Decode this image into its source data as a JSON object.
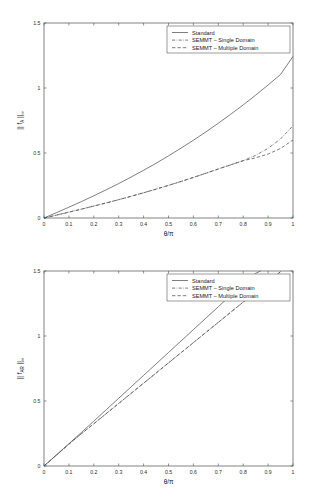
{
  "figure": {
    "background": "#ffffff",
    "line_color": "#545454",
    "axis_color": "#4d4d4d"
  },
  "legend": {
    "position": "top-right-inside",
    "entries": [
      {
        "label": "Standard",
        "style": "solid"
      },
      {
        "label": "SEMMT – Single Domain",
        "style": "dash-dot"
      },
      {
        "label": "SEMMT – Multiple Domain",
        "style": "dashed"
      }
    ]
  },
  "chart_data": [
    {
      "id": "top",
      "type": "line",
      "title": "",
      "xlabel": "θ/π",
      "ylabel": "|| f_A ||_∞",
      "ylabel_parts": {
        "prefix": "|| f",
        "sub": "A",
        "mid": " ||",
        "sup": "∞"
      },
      "xlim": [
        0,
        1
      ],
      "ylim": [
        0,
        1.5
      ],
      "grid": false,
      "xticks": [
        0,
        0.1,
        0.2,
        0.3,
        0.4,
        0.5,
        0.6,
        0.7,
        0.8,
        0.9,
        1
      ],
      "xticklabels": [
        "0",
        "0.1",
        "0.2",
        "0.3",
        "0.4",
        "0.5",
        "0.6",
        "0.7",
        "0.8",
        "0.9",
        "1"
      ],
      "yticks": [
        0,
        0.5,
        1,
        1.5
      ],
      "yticklabels": [
        "0",
        "0.5",
        "1",
        "1.5"
      ],
      "x": [
        0,
        0.05,
        0.1,
        0.15,
        0.2,
        0.25,
        0.3,
        0.35,
        0.4,
        0.45,
        0.5,
        0.55,
        0.6,
        0.65,
        0.7,
        0.75,
        0.8,
        0.85,
        0.9,
        0.95,
        1
      ],
      "series": [
        {
          "name": "Standard",
          "style": "solid",
          "values": [
            0,
            0.041,
            0.083,
            0.126,
            0.171,
            0.217,
            0.265,
            0.315,
            0.367,
            0.421,
            0.478,
            0.537,
            0.598,
            0.662,
            0.729,
            0.798,
            0.87,
            0.945,
            1.023,
            1.104,
            1.243
          ]
        },
        {
          "name": "SEMMT – Single Domain",
          "style": "dash-dot",
          "values": [
            0,
            0.022,
            0.045,
            0.068,
            0.092,
            0.116,
            0.141,
            0.167,
            0.194,
            0.222,
            0.251,
            0.281,
            0.312,
            0.344,
            0.377,
            0.409,
            0.441,
            0.482,
            0.536,
            0.608,
            0.71
          ]
        },
        {
          "name": "SEMMT – Multiple Domain",
          "style": "dashed",
          "values": [
            0,
            0.022,
            0.045,
            0.068,
            0.092,
            0.116,
            0.141,
            0.167,
            0.194,
            0.222,
            0.251,
            0.281,
            0.312,
            0.344,
            0.377,
            0.409,
            0.441,
            0.463,
            0.492,
            0.535,
            0.6
          ]
        }
      ]
    },
    {
      "id": "bottom",
      "type": "line",
      "title": "",
      "xlabel": "θ/π",
      "ylabel": "|| f_AR ||_∞",
      "ylabel_parts": {
        "prefix": "|| f",
        "sub": "AR",
        "mid": " ||",
        "sup": "∞"
      },
      "xlim": [
        0,
        1
      ],
      "ylim": [
        0,
        1.5
      ],
      "grid": false,
      "xticks": [
        0,
        0.1,
        0.2,
        0.3,
        0.4,
        0.5,
        0.6,
        0.7,
        0.8,
        0.9,
        1
      ],
      "xticklabels": [
        "0",
        "0.1",
        "0.2",
        "0.3",
        "0.4",
        "0.5",
        "0.6",
        "0.7",
        "0.8",
        "0.9",
        "1"
      ],
      "yticks": [
        0,
        0.5,
        1,
        1.5
      ],
      "yticklabels": [
        "0",
        "0.5",
        "1",
        "1.5"
      ],
      "x": [
        0,
        0.05,
        0.1,
        0.15,
        0.2,
        0.25,
        0.3,
        0.35,
        0.4,
        0.45,
        0.5,
        0.55,
        0.6,
        0.65,
        0.7,
        0.75,
        0.8,
        0.85,
        0.87
      ],
      "series": [
        {
          "name": "Standard",
          "style": "solid",
          "values": [
            0,
            0.085,
            0.171,
            0.258,
            0.345,
            0.433,
            0.521,
            0.609,
            0.697,
            0.785,
            0.873,
            0.961,
            1.049,
            1.137,
            1.225,
            1.313,
            1.401,
            1.482,
            1.5
          ]
        },
        {
          "name": "SEMMT – Single Domain",
          "style": "dash-dot",
          "x": [
            0,
            0.05,
            0.1,
            0.15,
            0.2,
            0.25,
            0.3,
            0.35,
            0.4,
            0.45,
            0.5,
            0.55,
            0.6,
            0.65,
            0.7,
            0.75,
            0.8,
            0.85,
            0.9,
            0.95
          ],
          "values": [
            0,
            0.084,
            0.168,
            0.248,
            0.325,
            0.403,
            0.481,
            0.559,
            0.637,
            0.715,
            0.793,
            0.871,
            0.949,
            1.027,
            1.105,
            1.183,
            1.261,
            1.339,
            1.417,
            1.495
          ]
        },
        {
          "name": "SEMMT – Multiple Domain",
          "style": "dashed",
          "x": [
            0,
            0.05,
            0.1,
            0.15,
            0.2,
            0.25,
            0.3,
            0.35,
            0.4,
            0.45,
            0.5,
            0.55,
            0.6,
            0.65,
            0.7,
            0.75,
            0.8,
            0.85,
            0.9,
            0.95
          ],
          "values": [
            0,
            0.084,
            0.168,
            0.248,
            0.325,
            0.403,
            0.481,
            0.559,
            0.637,
            0.715,
            0.793,
            0.871,
            0.949,
            1.027,
            1.105,
            1.183,
            1.261,
            1.339,
            1.417,
            1.495
          ]
        }
      ]
    }
  ]
}
